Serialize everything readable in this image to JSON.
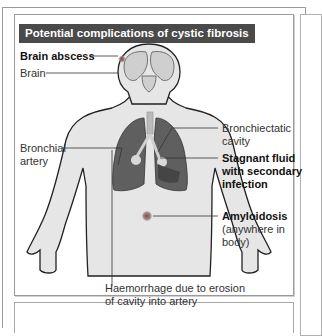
{
  "figure": {
    "title": "Potential complications of cystic fibrosis",
    "labels": {
      "brain_abscess": "Brain abscess",
      "brain": "Brain",
      "bronchial_artery_1": "Bronchial",
      "bronchial_artery_2": "artery",
      "bronchiectatic_cavity_1": "Bronchiectatic",
      "bronchiectatic_cavity_2": "cavity",
      "stagnant_fluid_1": "Stagnant fluid",
      "stagnant_fluid_2": "with secondary",
      "stagnant_fluid_3": "infection",
      "amyloidosis": "Amyloidosis",
      "amyloidosis_note_1": "(anywhere in",
      "amyloidosis_note_2": "body)",
      "haemorrhage_1": "Haemorrhage due to erosion",
      "haemorrhage_2": "of cavity into artery"
    },
    "colors": {
      "title_bg": "#4a4a4a",
      "title_text": "#ffffff",
      "body_fill": "#e6e6e6",
      "lung_fill": "#5f5f5f",
      "lesion": "#8a5a5a"
    }
  }
}
